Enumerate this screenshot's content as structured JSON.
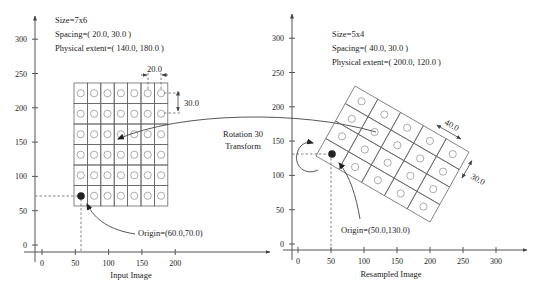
{
  "left_panel": {
    "info": {
      "size": "Size=7x6",
      "spacing": "Spacing=( 20.0, 30.0 )",
      "extent": "Physical extent=( 140.0, 180.0 )"
    },
    "caption": "Input Image",
    "x_ticks": [
      "0",
      "50",
      "100",
      "150",
      "200"
    ],
    "y_ticks": [
      "0",
      "50",
      "100",
      "150",
      "200",
      "250",
      "300"
    ],
    "grid": {
      "columns": 7,
      "rows": 6
    },
    "spacing_x_label": "20.0",
    "spacing_y_label": "30.0",
    "origin_label": "Origin=(60.0,70.0)"
  },
  "right_panel": {
    "info": {
      "size": "Size=5x4",
      "spacing": "Spacing=( 40.0, 30.0 )",
      "extent": "Physical extent=( 200.0, 120.0 )"
    },
    "caption": "Resampled Image",
    "x_ticks": [
      "0",
      "50",
      "100",
      "150",
      "200",
      "250",
      "300"
    ],
    "y_ticks": [
      "0",
      "50",
      "100",
      "150",
      "200",
      "250",
      "300"
    ],
    "grid": {
      "columns": 5,
      "rows": 4
    },
    "spacing_x_label": "40.0",
    "spacing_y_label": "30.0",
    "origin_label": "Origin=(50.0,130.0)"
  },
  "transform": {
    "line1": "Rotation 30",
    "line2": "Transform"
  }
}
